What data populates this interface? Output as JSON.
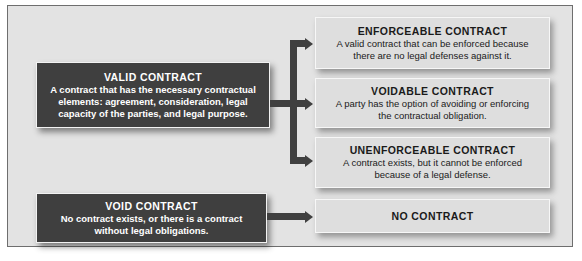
{
  "diagram": {
    "type": "flowchart",
    "colors": {
      "dark_box": "#3f3f3f",
      "light_box": "#dedede",
      "background": "#e3e3e3",
      "connector": "#404040"
    },
    "left": [
      {
        "title": "VALID CONTRACT",
        "description": "A contract that has the necessary contractual elements: agreement, consideration, legal capacity of the parties, and legal purpose."
      },
      {
        "title": "VOID CONTRACT",
        "description": "No contract exists, or there is a contract without legal obligations."
      }
    ],
    "right": [
      {
        "title": "ENFORCEABLE CONTRACT",
        "description": "A valid contract that can be enforced because there are no legal defenses against it."
      },
      {
        "title": "VOIDABLE CONTRACT",
        "description": "A party has the option of avoiding or enforcing the contractual obligation."
      },
      {
        "title": "UNENFORCEABLE CONTRACT",
        "description": "A contract exists, but it cannot be enforced because of a legal defense."
      },
      {
        "title": "NO CONTRACT"
      }
    ],
    "edges": [
      {
        "from": "VALID CONTRACT",
        "to": "ENFORCEABLE CONTRACT"
      },
      {
        "from": "VALID CONTRACT",
        "to": "VOIDABLE CONTRACT"
      },
      {
        "from": "VALID CONTRACT",
        "to": "UNENFORCEABLE CONTRACT"
      },
      {
        "from": "VOID CONTRACT",
        "to": "NO CONTRACT"
      }
    ]
  }
}
